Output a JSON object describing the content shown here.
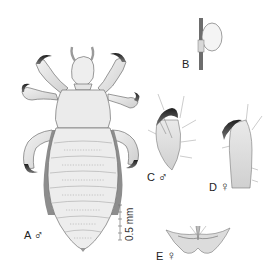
{
  "figure": {
    "panels": [
      {
        "id": "A",
        "label": "A",
        "sex_symbol": "♂",
        "description": "whole body dorsal view, male"
      },
      {
        "id": "B",
        "label": "B",
        "description": "egg (nit) attached to hair shaft"
      },
      {
        "id": "C",
        "label": "C",
        "sex_symbol": "♂",
        "description": "tarsal claw, male"
      },
      {
        "id": "D",
        "label": "D",
        "sex_symbol": "♀",
        "description": "tarsal claw, female"
      },
      {
        "id": "E",
        "label": "E",
        "sex_symbol": "♀",
        "description": "female genital region"
      }
    ],
    "scale_bar": {
      "label": "0.5 mm"
    },
    "colors": {
      "body_fill": "#ececec",
      "outline": "#6e6e6e",
      "dark_margin": "#8c8c8c",
      "claw": "#2a2a2a",
      "background": "#ffffff"
    }
  }
}
